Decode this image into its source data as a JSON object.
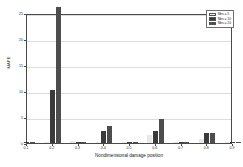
{
  "chart_data": {
    "type": "bar",
    "title": "",
    "xlabel": "Nondimensional damage position",
    "ylabel": "MAPE",
    "categories": [
      "0.1",
      "0.2",
      "0.3",
      "0.4",
      "0.5",
      "0.6",
      "0.7",
      "0.8",
      "0.9"
    ],
    "xlim": [
      0.1,
      0.9
    ],
    "ylim": [
      0,
      25
    ],
    "yticks": [
      0,
      5,
      10,
      15,
      20,
      25
    ],
    "xticks": [
      "0.1",
      "0.2",
      "0.3",
      "0.4",
      "0.5",
      "0.6",
      "0.7",
      "0.8",
      "0.9"
    ],
    "grid": true,
    "legend_position": "top-right",
    "series": [
      {
        "name": "Nbs = 5",
        "color": "#e8e8e8",
        "values": [
          0.15,
          0.12,
          0.35,
          0.1,
          0.2,
          1.45,
          0.1,
          0.75,
          0.1
        ]
      },
      {
        "name": "Nbs = 10",
        "color": "#3a3a3a",
        "values": [
          0.1,
          10.2,
          0.1,
          2.4,
          0.1,
          2.4,
          0.1,
          1.9,
          0.1
        ]
      },
      {
        "name": "Nbs = 20",
        "color": "#4d4d4d",
        "values": [
          0.1,
          26.2,
          0.1,
          3.2,
          0.1,
          4.6,
          0.1,
          2.0,
          0.1
        ]
      }
    ]
  }
}
